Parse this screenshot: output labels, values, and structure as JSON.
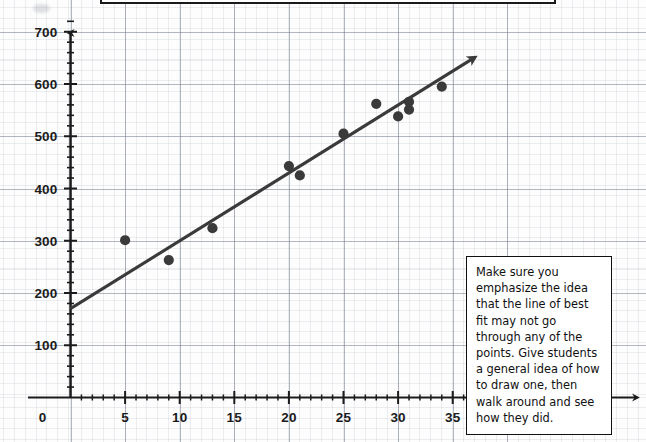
{
  "page": {
    "background_color": "#fdfdfd",
    "width": 646,
    "height": 442
  },
  "note": {
    "text": "Make sure you emphasize the idea that the line of best fit may not go through any of the points.  Give students a general idea of how to draw one, then walk around and see how they did.",
    "border_color": "#111111",
    "background_color": "#ffffff"
  },
  "chart_data": {
    "type": "scatter",
    "title": "",
    "xlabel": "",
    "ylabel": "",
    "xlim": [
      0,
      40
    ],
    "ylim": [
      0,
      730
    ],
    "grid": true,
    "legend": "none",
    "x_ticks": [
      0,
      5,
      10,
      15,
      20,
      25,
      30,
      35,
      40
    ],
    "x_tick_labels": [
      "0",
      "5",
      "10",
      "15",
      "20",
      "25",
      "30",
      "35",
      "4"
    ],
    "y_ticks": [
      100,
      200,
      300,
      400,
      500,
      600,
      700
    ],
    "y_tick_labels": [
      "100",
      "200",
      "300",
      "400",
      "500",
      "600",
      "700"
    ],
    "x_minor_step": 1,
    "y_minor_step": 20,
    "point_color": "#3a3a3a",
    "line_color": "#3a3a3a",
    "axis_color": "#1b1b1b",
    "points": [
      {
        "x": 5,
        "y": 301
      },
      {
        "x": 9,
        "y": 263
      },
      {
        "x": 13,
        "y": 324
      },
      {
        "x": 20,
        "y": 443
      },
      {
        "x": 21,
        "y": 425
      },
      {
        "x": 25,
        "y": 505
      },
      {
        "x": 28,
        "y": 562
      },
      {
        "x": 30,
        "y": 538
      },
      {
        "x": 31,
        "y": 566
      },
      {
        "x": 31,
        "y": 551
      },
      {
        "x": 34,
        "y": 595
      }
    ],
    "line_of_best_fit": {
      "label": "line of best fit",
      "x_start": 0,
      "y_start": 170,
      "x_end": 36.8,
      "y_end": 648,
      "arrow_end": true
    }
  }
}
